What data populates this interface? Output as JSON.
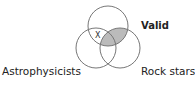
{
  "diagram": {
    "type": "venn",
    "sets": [
      {
        "id": "valid",
        "label": "Valid"
      },
      {
        "id": "astrophysicists",
        "label": "Astrophysicists"
      },
      {
        "id": "rockstars",
        "label": "Rock stars"
      }
    ],
    "marker": {
      "label": "X",
      "region": "Valid ∩ Astrophysicists only"
    },
    "shaded_region": "Valid ∩ Rock stars",
    "colors": {
      "stroke": "#777777",
      "shade": "#bbbbbb"
    }
  }
}
